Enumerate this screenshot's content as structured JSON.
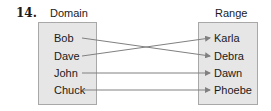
{
  "problem_number": "14.",
  "domain": {
    "title": "Domain",
    "items": [
      "Bob",
      "Dave",
      "John",
      "Chuck"
    ]
  },
  "range": {
    "title": "Range",
    "items": [
      "Karla",
      "Debra",
      "Dawn",
      "Phoebe"
    ]
  },
  "mapping": [
    {
      "from": "Bob",
      "to": "Debra"
    },
    {
      "from": "Dave",
      "to": "Karla"
    },
    {
      "from": "John",
      "to": "Dawn"
    },
    {
      "from": "Chuck",
      "to": "Phoebe"
    }
  ],
  "colors": {
    "box_fill": "#e6e6e6",
    "box_border": "#a8a8a8",
    "arrow": "#808080"
  }
}
